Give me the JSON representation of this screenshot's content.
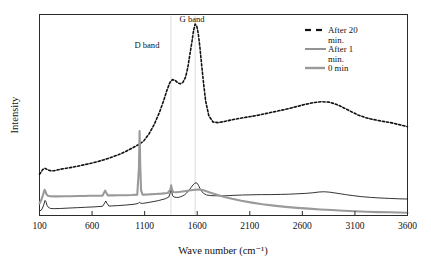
{
  "chart_data": {
    "type": "line",
    "title": "",
    "xlabel": "Wave number (cm⁻¹)",
    "ylabel": "Intensity",
    "xlim": [
      100,
      3600
    ],
    "ylim": [
      0,
      1
    ],
    "xticks": [
      100,
      600,
      1100,
      1600,
      2100,
      2600,
      3100,
      3600
    ],
    "xticklabels": [
      "100",
      "600",
      "1100",
      "1600",
      "2100",
      "2600",
      "3100",
      "3600"
    ],
    "yticks": [],
    "yticklabels": [],
    "grid": false,
    "legend_position": "upper right",
    "annotations": [
      {
        "text": "D band",
        "x": 1350,
        "note": "label for D band peak near 1350 cm-1"
      },
      {
        "text": "G band",
        "x": 1580,
        "note": "label for G band peak near 1580 cm-1"
      }
    ],
    "guide_lines_x": [
      1350,
      1580
    ],
    "series": [
      {
        "name": "After 20 min.",
        "style": "dashed",
        "color": "#111111",
        "width": 1.6,
        "x": [
          100,
          130,
          150,
          165,
          185,
          210,
          240,
          280,
          330,
          390,
          450,
          520,
          600,
          680,
          760,
          840,
          910,
          980,
          1040,
          1090,
          1140,
          1190,
          1240,
          1280,
          1310,
          1340,
          1365,
          1390,
          1415,
          1440,
          1465,
          1490,
          1510,
          1530,
          1550,
          1565,
          1580,
          1595,
          1610,
          1625,
          1640,
          1660,
          1680,
          1710,
          1750,
          1800,
          1860,
          1930,
          2000,
          2080,
          2170,
          2260,
          2350,
          2440,
          2530,
          2620,
          2700,
          2780,
          2850,
          2900,
          2950,
          3000,
          3060,
          3130,
          3200,
          3280,
          3360,
          3440,
          3520,
          3600
        ],
        "y": [
          0.205,
          0.228,
          0.235,
          0.231,
          0.226,
          0.222,
          0.223,
          0.228,
          0.233,
          0.238,
          0.244,
          0.252,
          0.261,
          0.272,
          0.285,
          0.3,
          0.316,
          0.335,
          0.352,
          0.37,
          0.405,
          0.452,
          0.512,
          0.57,
          0.62,
          0.662,
          0.676,
          0.672,
          0.66,
          0.655,
          0.663,
          0.69,
          0.735,
          0.8,
          0.865,
          0.92,
          0.952,
          0.944,
          0.905,
          0.84,
          0.76,
          0.66,
          0.57,
          0.497,
          0.465,
          0.462,
          0.468,
          0.476,
          0.483,
          0.49,
          0.498,
          0.508,
          0.518,
          0.528,
          0.54,
          0.552,
          0.561,
          0.566,
          0.564,
          0.557,
          0.547,
          0.534,
          0.518,
          0.5,
          0.487,
          0.477,
          0.469,
          0.462,
          0.452,
          0.442
        ]
      },
      {
        "name": "After 1 min.",
        "style": "solid",
        "color": "#111111",
        "width": 0.85,
        "x": [
          100,
          120,
          140,
          152,
          162,
          172,
          185,
          205,
          240,
          300,
          380,
          460,
          540,
          620,
          700,
          720,
          730,
          740,
          760,
          840,
          920,
          1000,
          1040,
          1050,
          1060,
          1080,
          1150,
          1230,
          1300,
          1330,
          1345,
          1352,
          1358,
          1366,
          1380,
          1400,
          1420,
          1440,
          1460,
          1480,
          1500,
          1520,
          1540,
          1560,
          1575,
          1590,
          1600,
          1612,
          1625,
          1640,
          1660,
          1690,
          1730,
          1790,
          1860,
          1940,
          2030,
          2120,
          2210,
          2300,
          2390,
          2470,
          2550,
          2630,
          2700,
          2760,
          2810,
          2860,
          2900,
          2950,
          3010,
          3080,
          3160,
          3250,
          3340,
          3430,
          3520,
          3600
        ],
        "y": [
          0.022,
          0.028,
          0.052,
          0.075,
          0.068,
          0.05,
          0.04,
          0.035,
          0.034,
          0.035,
          0.037,
          0.039,
          0.041,
          0.043,
          0.046,
          0.062,
          0.072,
          0.062,
          0.047,
          0.049,
          0.052,
          0.056,
          0.06,
          0.066,
          0.062,
          0.06,
          0.066,
          0.074,
          0.084,
          0.092,
          0.115,
          0.14,
          0.118,
          0.098,
          0.092,
          0.09,
          0.09,
          0.093,
          0.097,
          0.103,
          0.112,
          0.124,
          0.138,
          0.152,
          0.16,
          0.163,
          0.16,
          0.15,
          0.136,
          0.122,
          0.11,
          0.102,
          0.099,
          0.098,
          0.098,
          0.1,
          0.102,
          0.103,
          0.104,
          0.104,
          0.105,
          0.106,
          0.108,
          0.11,
          0.113,
          0.117,
          0.118,
          0.116,
          0.113,
          0.109,
          0.104,
          0.099,
          0.094,
          0.09,
          0.087,
          0.085,
          0.083,
          0.082
        ]
      },
      {
        "name": "0 min",
        "style": "solid",
        "color": "#9a9a9a",
        "width": 2.1,
        "x": [
          100,
          118,
          135,
          148,
          158,
          168,
          180,
          200,
          230,
          280,
          340,
          400,
          460,
          520,
          580,
          640,
          700,
          715,
          725,
          735,
          750,
          800,
          860,
          920,
          980,
          1030,
          1046,
          1052,
          1058,
          1066,
          1080,
          1140,
          1200,
          1260,
          1320,
          1345,
          1352,
          1360,
          1372,
          1400,
          1440,
          1480,
          1520,
          1560,
          1600,
          1640,
          1660,
          1680,
          1720,
          1780,
          1850,
          1930,
          2020,
          2120,
          2220,
          2330,
          2440,
          2550,
          2660,
          2770,
          2880,
          2990,
          3100,
          3210,
          3320,
          3430,
          3520,
          3600
        ],
        "y": [
          0.06,
          0.078,
          0.105,
          0.128,
          0.118,
          0.104,
          0.098,
          0.096,
          0.095,
          0.095,
          0.096,
          0.096,
          0.097,
          0.097,
          0.098,
          0.098,
          0.099,
          0.114,
          0.124,
          0.113,
          0.1,
          0.1,
          0.101,
          0.101,
          0.102,
          0.104,
          0.24,
          0.42,
          0.25,
          0.125,
          0.104,
          0.105,
          0.107,
          0.109,
          0.112,
          0.128,
          0.15,
          0.13,
          0.117,
          0.116,
          0.118,
          0.121,
          0.124,
          0.127,
          0.129,
          0.128,
          0.126,
          0.122,
          0.114,
          0.104,
          0.093,
          0.083,
          0.073,
          0.064,
          0.056,
          0.049,
          0.043,
          0.038,
          0.034,
          0.03,
          0.027,
          0.024,
          0.021,
          0.019,
          0.017,
          0.016,
          0.015,
          0.014
        ]
      }
    ]
  },
  "legend": {
    "entries": [
      {
        "label_line1": "After 20",
        "label_line2": "min.",
        "style": "dashed",
        "color": "#111111"
      },
      {
        "label_line1": "After 1",
        "label_line2": "min.",
        "style": "solid",
        "color": "#111111"
      },
      {
        "label_line1": "0 min",
        "label_line2": "",
        "style": "thick-grey",
        "color": "#9a9a9a"
      }
    ]
  }
}
